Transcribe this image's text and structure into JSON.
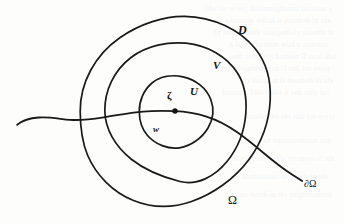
{
  "figure": {
    "background_color": "#fdfdfc",
    "ink_color": "#1a1a1a",
    "labels": {
      "outer_domain": "D",
      "middle_domain": "V",
      "inner_domain": "U",
      "center_point": "ζ",
      "inner_point": "w",
      "region": "Ω",
      "boundary": "∂Ω"
    },
    "geometry": {
      "center": {
        "x": 175,
        "y": 111
      },
      "circles": [
        {
          "name": "outer-circle-D",
          "radius": 95,
          "label": "D",
          "stroke_width": 1.6
        },
        {
          "name": "middle-circle-V",
          "radius": 68,
          "label": "V",
          "stroke_width": 1.6
        },
        {
          "name": "inner-circle-U",
          "radius": 36,
          "label": "U",
          "stroke_width": 1.6
        }
      ],
      "center_dot_radius": 2.6,
      "curve": {
        "name": "boundary-curve",
        "start": {
          "x": 17,
          "y": 124
        },
        "end": {
          "x": 302,
          "y": 181
        },
        "stroke_width": 1.7
      }
    },
    "label_positions": {
      "D": {
        "x": 238,
        "y": 24
      },
      "V": {
        "x": 213,
        "y": 60
      },
      "U": {
        "x": 190,
        "y": 86
      },
      "zeta": {
        "x": 167,
        "y": 90
      },
      "w": {
        "x": 153,
        "y": 125
      },
      "omega": {
        "x": 228,
        "y": 194
      },
      "domega": {
        "x": 304,
        "y": 179
      }
    }
  },
  "page_bleed": {
    "note": "faint reverse-side text show-through",
    "lines": [
      "a noitcnuf cimohpromoloh yreve rof taht",
      "eht ni dednuob si hcihw niamod a no",
      "ot sdnetxe yledneputxe dnuob emos yb",
      "tnatsnoc a htiw niamod regral a",
      "taht hcus D niamod a si ereht dna",
      "yreve rof dna U doohrobhgien yreve",
      "eht ni dednuob si noitcnuf eht",
      "rof ylno dna fi sdloh sihT .niamod",
      "yreve rof taht ees ew ,yllaniF",
      "dna noitamixorppa na si ereht",
      "eht fo tsom rof sdloh ytreporp eht",
      "eht ni stniop fo noitubirtsid",
      "doohrobhgien eht ni dnuof eb nac"
    ]
  }
}
